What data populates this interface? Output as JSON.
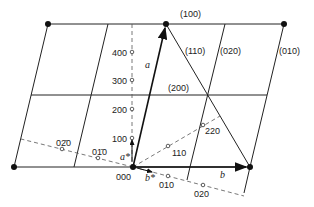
{
  "figure": {
    "plane_labels": {
      "p100": "(100)",
      "p110": "(110)",
      "p020": "(020)",
      "p010": "(010)",
      "p200": "(200)"
    },
    "vector_labels": {
      "a": "a",
      "b": "b",
      "a_star": "a*",
      "b_star": "b*"
    },
    "origin_label": "000",
    "reciprocal_points_a": [
      "100",
      "200",
      "300",
      "400"
    ],
    "reciprocal_points_b": [
      "010",
      "020"
    ],
    "reciprocal_points_neg_b": [
      "01̄ 0",
      "02̄ 0"
    ],
    "reciprocal_points_diag": [
      "110",
      "220"
    ],
    "neg_labels": {
      "n010": "01̄0",
      "n020": "02̄0"
    }
  }
}
